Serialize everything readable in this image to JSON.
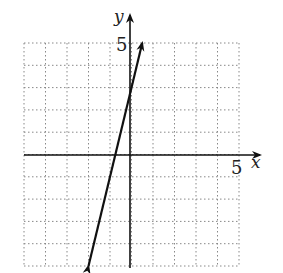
{
  "chart_data": {
    "type": "line",
    "title": "",
    "xlabel": "x",
    "ylabel": "y",
    "xlim": [
      -5,
      5
    ],
    "ylim": [
      -5,
      5
    ],
    "grid": true,
    "grid_style": "dotted",
    "tick_labels": {
      "x": [
        "5"
      ],
      "y": [
        "5"
      ]
    },
    "series": [
      {
        "name": "line",
        "equation": "y = 4x + 3",
        "x": [
          -2,
          0.5
        ],
        "y": [
          -5,
          5
        ],
        "arrows": "both"
      }
    ]
  },
  "labels": {
    "x_axis": "x",
    "y_axis": "y",
    "x_tick": "5",
    "y_tick": "5"
  }
}
